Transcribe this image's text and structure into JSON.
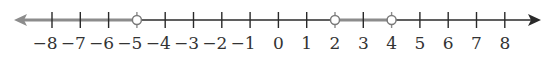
{
  "number_line": {
    "min": -8,
    "max": 8,
    "ticks": [
      -8,
      -7,
      -6,
      -5,
      -4,
      -3,
      -2,
      -1,
      0,
      1,
      2,
      3,
      4,
      5,
      6,
      7,
      8
    ],
    "tick_labels": [
      "−8",
      "−7",
      "−6",
      "−5",
      "−4",
      "−3",
      "−2",
      "−1",
      "0",
      "1",
      "2",
      "3",
      "4",
      "5",
      "6",
      "7",
      "8"
    ],
    "arrows": {
      "left": true,
      "right": true
    },
    "shaded_intervals": [
      {
        "from": "-infinity",
        "to": -5,
        "left_endpoint": "arrow",
        "right_endpoint": "open"
      },
      {
        "from": 2,
        "to": 4,
        "left_endpoint": "open",
        "right_endpoint": "open"
      }
    ],
    "open_points": [
      -5,
      2,
      4
    ],
    "solution_set": "(-∞, -5) ∪ (2, 4)",
    "colors": {
      "axis": "#2a2a2a",
      "shaded": "#8c8c8c",
      "open_point_fill": "#ffffff",
      "open_point_stroke": "#7a7a7a",
      "label": "#333333"
    }
  }
}
